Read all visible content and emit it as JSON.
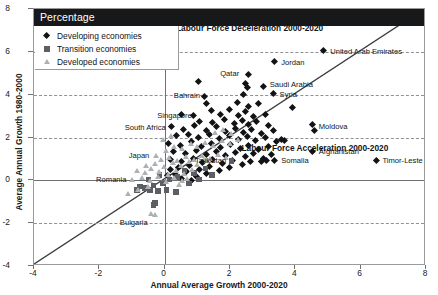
{
  "header": {
    "bar_label": "Percentage"
  },
  "legend": {
    "items": [
      {
        "label": "Developing economies",
        "marker": "diamond",
        "color": "#111315"
      },
      {
        "label": "Transition economies",
        "marker": "square",
        "color": "#5b5e62"
      },
      {
        "label": "Developed economies",
        "marker": "triangle",
        "color": "#aeb1b4"
      }
    ]
  },
  "annotations": {
    "deceleration": "Labour Force Deceleration 2000-2020",
    "acceleration": "Labour Force Acceleration 2000-2020"
  },
  "chart_data": {
    "type": "scatter",
    "title": "Percentage",
    "xlabel": "Annual Average Growth 2000-2020",
    "ylabel": "Average Annual Growth 1980-2000",
    "xlim": [
      -4,
      8
    ],
    "ylim": [
      -4,
      8
    ],
    "xticks": [
      -4,
      -2,
      0,
      2,
      4,
      6,
      8
    ],
    "yticks": [
      -4,
      -2,
      0,
      2,
      4,
      6,
      8
    ],
    "grid": "horizontal-dashed",
    "legend_position": "top-left",
    "reference_line": {
      "type": "identity",
      "from": [
        -4,
        -4
      ],
      "to": [
        8,
        8
      ]
    },
    "quadrant_labels": [
      {
        "text": "Labour Force Deceleration 2000-2020",
        "x": 2.6,
        "y": 7.1
      },
      {
        "text": "Labour Force Acceleration 2000-2020",
        "x": 4.6,
        "y": 1.5
      }
    ],
    "series": [
      {
        "name": "Developing economies",
        "marker": "diamond",
        "color": "#111315",
        "points": [
          [
            4.9,
            6.0
          ],
          [
            3.4,
            5.5
          ],
          [
            2.6,
            4.9
          ],
          [
            2.5,
            4.5
          ],
          [
            2.55,
            4.3
          ],
          [
            3.05,
            4.35
          ],
          [
            3.35,
            4.0
          ],
          [
            2.45,
            3.95
          ],
          [
            1.25,
            3.85
          ],
          [
            1.3,
            3.55
          ],
          [
            2.25,
            3.6
          ],
          [
            2.6,
            3.4
          ],
          [
            2.9,
            3.55
          ],
          [
            3.95,
            3.35
          ],
          [
            0.55,
            3.05
          ],
          [
            0.9,
            3.0
          ],
          [
            1.45,
            3.2
          ],
          [
            1.75,
            3.05
          ],
          [
            2.0,
            3.25
          ],
          [
            2.3,
            3.0
          ],
          [
            2.5,
            3.15
          ],
          [
            2.75,
            2.95
          ],
          [
            3.1,
            3.05
          ],
          [
            1.1,
            2.7
          ],
          [
            1.5,
            2.65
          ],
          [
            1.85,
            2.8
          ],
          [
            2.15,
            2.6
          ],
          [
            2.4,
            2.75
          ],
          [
            2.6,
            2.55
          ],
          [
            2.85,
            2.7
          ],
          [
            3.2,
            2.5
          ],
          [
            4.55,
            2.55
          ],
          [
            4.6,
            2.3
          ],
          [
            0.25,
            2.45
          ],
          [
            0.6,
            2.35
          ],
          [
            0.95,
            2.5
          ],
          [
            1.3,
            2.3
          ],
          [
            1.6,
            2.45
          ],
          [
            1.9,
            2.25
          ],
          [
            2.2,
            2.4
          ],
          [
            2.45,
            2.2
          ],
          [
            2.7,
            2.35
          ],
          [
            3.0,
            2.15
          ],
          [
            3.35,
            2.3
          ],
          [
            0.4,
            2.05
          ],
          [
            0.75,
            2.1
          ],
          [
            1.05,
            1.95
          ],
          [
            1.4,
            2.1
          ],
          [
            1.7,
            1.9
          ],
          [
            2.0,
            2.05
          ],
          [
            2.3,
            1.85
          ],
          [
            2.55,
            2.0
          ],
          [
            2.8,
            1.8
          ],
          [
            3.1,
            1.95
          ],
          [
            3.45,
            1.75
          ],
          [
            3.6,
            1.85
          ],
          [
            3.7,
            1.8
          ],
          [
            4.55,
            1.3
          ],
          [
            6.5,
            0.9
          ],
          [
            3.4,
            0.9
          ],
          [
            0.15,
            1.7
          ],
          [
            0.5,
            1.6
          ],
          [
            0.85,
            1.75
          ],
          [
            1.15,
            1.55
          ],
          [
            1.45,
            1.7
          ],
          [
            1.75,
            1.5
          ],
          [
            2.05,
            1.65
          ],
          [
            2.35,
            1.45
          ],
          [
            2.6,
            1.6
          ],
          [
            2.9,
            1.4
          ],
          [
            3.2,
            1.55
          ],
          [
            0.3,
            1.3
          ],
          [
            0.65,
            1.2
          ],
          [
            1.0,
            1.35
          ],
          [
            1.3,
            1.15
          ],
          [
            1.6,
            1.3
          ],
          [
            1.9,
            1.1
          ],
          [
            2.2,
            1.25
          ],
          [
            2.5,
            1.05
          ],
          [
            2.75,
            1.2
          ],
          [
            3.05,
            1.0
          ],
          [
            3.3,
            1.15
          ],
          [
            0.2,
            0.95
          ],
          [
            0.55,
            0.85
          ],
          [
            0.9,
            1.0
          ],
          [
            1.2,
            0.8
          ],
          [
            1.5,
            0.95
          ],
          [
            1.8,
            0.75
          ],
          [
            2.1,
            0.9
          ],
          [
            2.4,
            0.7
          ],
          [
            2.65,
            0.85
          ],
          [
            0.45,
            0.55
          ],
          [
            0.8,
            0.65
          ],
          [
            1.1,
            0.45
          ],
          [
            1.4,
            0.6
          ],
          [
            1.7,
            0.4
          ],
          [
            2.0,
            0.55
          ],
          [
            0.35,
            0.25
          ],
          [
            0.7,
            0.35
          ],
          [
            1.0,
            0.15
          ],
          [
            1.3,
            0.3
          ],
          [
            0.55,
            0.05
          ],
          [
            0.85,
            -0.05
          ],
          [
            3.0,
            0.85
          ],
          [
            3.15,
            0.88
          ],
          [
            1.05,
            4.55
          ],
          [
            0.2,
            0.45
          ],
          [
            0.1,
            0.2
          ]
        ]
      },
      {
        "name": "Transition economies",
        "marker": "square",
        "color": "#5b5e62",
        "points": [
          [
            2.05,
            0.9
          ],
          [
            0.4,
            0.15
          ],
          [
            0.15,
            0.05
          ],
          [
            -0.05,
            -0.15
          ],
          [
            -0.35,
            -0.25
          ],
          [
            -0.6,
            -0.35
          ],
          [
            -0.75,
            -0.3
          ],
          [
            -0.45,
            -0.45
          ],
          [
            -0.2,
            -0.5
          ],
          [
            0.05,
            -0.45
          ],
          [
            0.35,
            -0.55
          ],
          [
            -0.3,
            -1.05
          ],
          [
            -0.35,
            -1.15
          ],
          [
            -0.85,
            -0.45
          ],
          [
            1.25,
            0.55
          ],
          [
            0.9,
            0.35
          ],
          [
            0.6,
            0.45
          ],
          [
            -0.15,
            0.25
          ],
          [
            -0.5,
            0.05
          ],
          [
            0.75,
            -0.15
          ],
          [
            1.05,
            0.05
          ],
          [
            1.45,
            0.25
          ]
        ]
      },
      {
        "name": "Developed economies",
        "marker": "triangle",
        "color": "#aeb1b4",
        "points": [
          [
            -0.25,
            1.15
          ],
          [
            0.05,
            1.35
          ],
          [
            0.3,
            1.55
          ],
          [
            0.55,
            1.45
          ],
          [
            0.8,
            1.7
          ],
          [
            1.0,
            1.55
          ],
          [
            1.25,
            1.75
          ],
          [
            1.5,
            1.6
          ],
          [
            1.75,
            1.85
          ],
          [
            2.0,
            1.7
          ],
          [
            2.25,
            1.9
          ],
          [
            -0.1,
            0.95
          ],
          [
            0.15,
            1.05
          ],
          [
            0.4,
            0.9
          ],
          [
            0.65,
            1.1
          ],
          [
            0.9,
            0.95
          ],
          [
            1.15,
            1.15
          ],
          [
            1.4,
            1.0
          ],
          [
            1.65,
            1.2
          ],
          [
            1.9,
            1.05
          ],
          [
            -0.55,
            0.65
          ],
          [
            -0.3,
            0.75
          ],
          [
            0.0,
            0.6
          ],
          [
            0.25,
            0.8
          ],
          [
            0.5,
            0.65
          ],
          [
            0.75,
            0.85
          ],
          [
            1.0,
            0.7
          ],
          [
            1.3,
            0.9
          ],
          [
            -0.85,
            0.45
          ],
          [
            -0.6,
            0.35
          ],
          [
            -0.4,
            0.55
          ],
          [
            -0.15,
            0.4
          ],
          [
            0.1,
            0.25
          ],
          [
            0.35,
            0.45
          ],
          [
            0.6,
            0.3
          ],
          [
            0.85,
            0.5
          ],
          [
            -1.0,
            0.0
          ],
          [
            -0.7,
            0.1
          ],
          [
            -0.45,
            -0.05
          ],
          [
            -0.2,
            0.15
          ],
          [
            0.05,
            -0.1
          ],
          [
            0.3,
            0.1
          ],
          [
            0.55,
            -0.05
          ],
          [
            -1.1,
            -0.65
          ],
          [
            -0.8,
            -0.45
          ],
          [
            -0.5,
            -0.3
          ],
          [
            -0.3,
            -1.6
          ],
          [
            -0.4,
            -1.55
          ],
          [
            0.45,
            -0.2
          ],
          [
            0.7,
            0.05
          ],
          [
            -0.05,
            1.9
          ],
          [
            0.2,
            2.05
          ],
          [
            1.55,
            2.2
          ],
          [
            1.8,
            2.35
          ],
          [
            2.05,
            2.15
          ]
        ]
      }
    ],
    "labeled_points": [
      {
        "name": "United Arab Emirates",
        "x": 4.9,
        "y": 6.0,
        "side": "left",
        "series": "Developing economies"
      },
      {
        "name": "Jordan",
        "x": 3.4,
        "y": 5.5,
        "side": "left",
        "series": "Developing economies"
      },
      {
        "name": "Qatar",
        "x": 2.45,
        "y": 4.95,
        "side": "right",
        "series": "Developing economies"
      },
      {
        "name": "Saudi Arabia",
        "x": 3.05,
        "y": 4.45,
        "side": "left",
        "series": "Developing economies"
      },
      {
        "name": "Syria",
        "x": 3.35,
        "y": 4.0,
        "side": "left",
        "series": "Developing economies"
      },
      {
        "name": "Bahrain",
        "x": 1.25,
        "y": 3.95,
        "side": "right",
        "series": "Developing economies"
      },
      {
        "name": "Moldova",
        "x": 4.55,
        "y": 2.5,
        "side": "left",
        "series": "Developing economies"
      },
      {
        "name": "Afghanistan",
        "x": 4.55,
        "y": 1.3,
        "side": "left",
        "series": "Developing economies"
      },
      {
        "name": "Singapore",
        "x": 1.0,
        "y": 3.0,
        "side": "right",
        "series": "Developing economies"
      },
      {
        "name": "South Africa",
        "x": 0.2,
        "y": 2.45,
        "side": "right",
        "series": "Developing economies"
      },
      {
        "name": "Japan",
        "x": -0.3,
        "y": 1.15,
        "side": "right",
        "series": "Developed economies"
      },
      {
        "name": "Romania",
        "x": -1.0,
        "y": 0.0,
        "side": "right",
        "series": "Developed economies"
      },
      {
        "name": "Bulgaria",
        "x": -0.35,
        "y": -2.0,
        "side": "right",
        "series": "Developed economies"
      },
      {
        "name": "Tajikistan",
        "x": 2.05,
        "y": 0.9,
        "side": "right",
        "series": "Transition economies"
      },
      {
        "name": "Somalia",
        "x": 3.4,
        "y": 0.9,
        "side": "left",
        "series": "Developing economies"
      },
      {
        "name": "Timor-Leste",
        "x": 6.5,
        "y": 0.9,
        "side": "left",
        "series": "Developing economies"
      }
    ]
  }
}
